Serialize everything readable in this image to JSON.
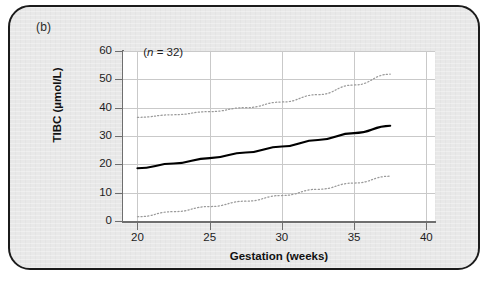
{
  "panel": {
    "label": "(b)"
  },
  "chart_data": {
    "type": "line",
    "title": "",
    "subtitle": "",
    "xlabel": "Gestation (weeks)",
    "ylabel": "TIBC (µmol/L)",
    "xlim": [
      19.0,
      40.6
    ],
    "ylim": [
      0,
      60
    ],
    "xticks": [
      20,
      25,
      30,
      35,
      40
    ],
    "yticks": [
      0,
      10,
      20,
      30,
      40,
      50,
      60
    ],
    "xtick_labels": [
      "20",
      "25",
      "30",
      "35",
      "40"
    ],
    "ytick_labels": [
      "0",
      "10",
      "20",
      "30",
      "40",
      "50",
      "60"
    ],
    "grid": true,
    "legend": "none",
    "annotations": [
      {
        "name": "sample-size",
        "text_prefix": "(",
        "text_italic": "n",
        "text_suffix": " = 32)",
        "x": 20.4,
        "y": 59
      }
    ],
    "series": [
      {
        "name": "mean",
        "style": "solid",
        "color": "#000000",
        "x": [
          20.0,
          22.5,
          25.0,
          27.5,
          30.0,
          32.5,
          35.0,
          37.5
        ],
        "values": [
          18.6,
          20.3,
          22.2,
          24.2,
          26.3,
          28.6,
          31.0,
          33.6
        ]
      },
      {
        "name": "upper-reference-limit",
        "style": "dotted",
        "color": "#9a9a9a",
        "x": [
          20.0,
          22.5,
          25.0,
          27.5,
          30.0,
          32.5,
          35.0,
          37.5
        ],
        "values": [
          36.6,
          37.5,
          38.6,
          40.0,
          42.0,
          44.6,
          48.0,
          51.8
        ]
      },
      {
        "name": "lower-reference-limit",
        "style": "dotted",
        "color": "#9a9a9a",
        "x": [
          20.0,
          22.5,
          25.0,
          27.5,
          30.0,
          32.5,
          35.0,
          37.5
        ],
        "values": [
          1.5,
          3.3,
          5.1,
          7.0,
          9.0,
          11.2,
          13.4,
          15.8
        ]
      }
    ]
  }
}
